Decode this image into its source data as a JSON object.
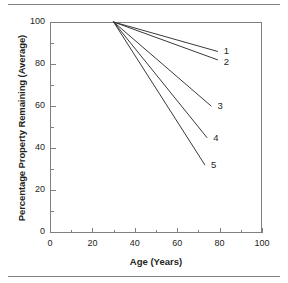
{
  "figure": {
    "rule_color": "#808080",
    "axis_color": "#808080",
    "line_color": "#3a3a3a"
  },
  "chart_data": {
    "type": "line",
    "title": "",
    "xlabel": "Age (Years)",
    "ylabel": "Percentage Property Remaining (Average)",
    "xlim": [
      0,
      100
    ],
    "ylim": [
      0,
      100
    ],
    "xticks": [
      0,
      20,
      40,
      60,
      80,
      100
    ],
    "yticks": [
      0,
      20,
      40,
      60,
      80,
      100
    ],
    "xtick_labels": [
      "0",
      "20",
      "40",
      "60",
      "80",
      "100"
    ],
    "ytick_labels": [
      "0",
      "20",
      "40",
      "60",
      "80",
      "100"
    ],
    "minor_ticks": true,
    "grid": false,
    "legend_position": "right-of-line-ends",
    "series": [
      {
        "name": "1",
        "x": [
          30,
          79
        ],
        "y": [
          100,
          86
        ]
      },
      {
        "name": "2",
        "x": [
          30,
          79
        ],
        "y": [
          100,
          82
        ]
      },
      {
        "name": "3",
        "x": [
          30,
          76
        ],
        "y": [
          100,
          60
        ]
      },
      {
        "name": "4",
        "x": [
          30,
          74
        ],
        "y": [
          100,
          45
        ]
      },
      {
        "name": "5",
        "x": [
          30,
          73
        ],
        "y": [
          100,
          32
        ]
      }
    ],
    "annotations": [
      {
        "text": "1",
        "x": 82,
        "y": 86
      },
      {
        "text": "2",
        "x": 82,
        "y": 81
      },
      {
        "text": "3",
        "x": 79,
        "y": 60
      },
      {
        "text": "4",
        "x": 77,
        "y": 45
      },
      {
        "text": "5",
        "x": 76,
        "y": 32
      }
    ]
  }
}
